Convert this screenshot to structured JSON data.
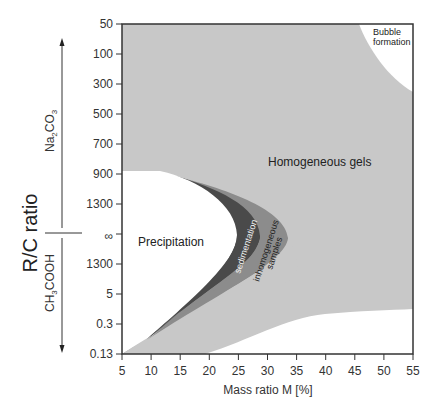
{
  "chart_data": {
    "type": "phase-diagram",
    "title": "",
    "xlabel": "Mass ratio M [%]",
    "ylabel": "R/C ratio",
    "x_ticks": [
      "5",
      "10",
      "15",
      "20",
      "25",
      "30",
      "35",
      "40",
      "45",
      "50",
      "55"
    ],
    "xlim": [
      5,
      55
    ],
    "y_ticks": [
      "50",
      "100",
      "300",
      "500",
      "700",
      "900",
      "1300",
      "∞",
      "1300",
      "5",
      "0.3",
      "0.13"
    ],
    "y_direction_labels": {
      "upper": "Na2CO3",
      "lower": "CH3COOH"
    },
    "regions": [
      {
        "name": "Homogeneous gels",
        "color": "#c8c8c8"
      },
      {
        "name": "Precipitation",
        "color": "#ffffff"
      },
      {
        "name": "sedimentation",
        "color": "#4a4a4a"
      },
      {
        "name": "inhomogeneous samples",
        "color": "#8c8c8c"
      },
      {
        "name": "Bubble formation",
        "color": "#ffffff"
      }
    ]
  },
  "labels": {
    "homogeneous": "Homogeneous gels",
    "precipitation": "Precipitation",
    "sedimentation": "sedimentation",
    "inhomogeneous_1": "inhomogeneous",
    "inhomogeneous_2": "samples",
    "bubble_1": "Bubble",
    "bubble_2": "formation",
    "ylabel": "R/C ratio",
    "xlabel": "Mass ratio M [%]",
    "na2co3_main": "Na",
    "na2co3_sub1": "2",
    "na2co3_mid": "CO",
    "na2co3_sub2": "3",
    "ch3cooh_main": "CH",
    "ch3cooh_sub": "3",
    "ch3cooh_rest": "COOH"
  }
}
